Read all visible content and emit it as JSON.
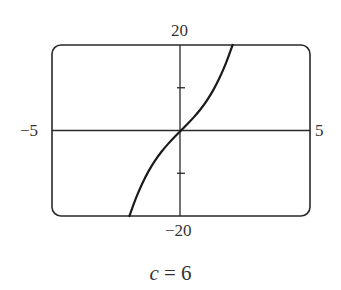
{
  "chart_data": {
    "type": "line",
    "title": "",
    "caption": "c = 6",
    "caption_var": "c",
    "caption_eq": " = ",
    "caption_val": "6",
    "function": "y = x^3 + 6x",
    "xlabel": "",
    "ylabel": "",
    "xlim": [
      -5,
      5
    ],
    "ylim": [
      -20,
      20
    ],
    "tick_labels": {
      "x_min": "−5",
      "x_max": "5",
      "y_max": "20",
      "y_min": "−20"
    },
    "y_ticks": [
      -10,
      10
    ],
    "grid": false,
    "legend": null,
    "series": [
      {
        "name": "c = 6",
        "x": [
          -2.0,
          -1.75,
          -1.5,
          -1.25,
          -1.0,
          -0.75,
          -0.5,
          -0.25,
          0.0,
          0.25,
          0.5,
          0.75,
          1.0,
          1.25,
          1.5,
          1.75,
          2.0
        ],
        "y": [
          -20.0,
          -15.86,
          -12.38,
          -9.45,
          -7.0,
          -4.92,
          -3.13,
          -1.52,
          0.0,
          1.52,
          3.13,
          4.92,
          7.0,
          9.45,
          12.38,
          15.86,
          20.0
        ]
      }
    ]
  },
  "colors": {
    "frame": "#2a2a2a",
    "axes": "#2a2a2a",
    "curve": "#1a1a1a",
    "text": "#333333"
  }
}
